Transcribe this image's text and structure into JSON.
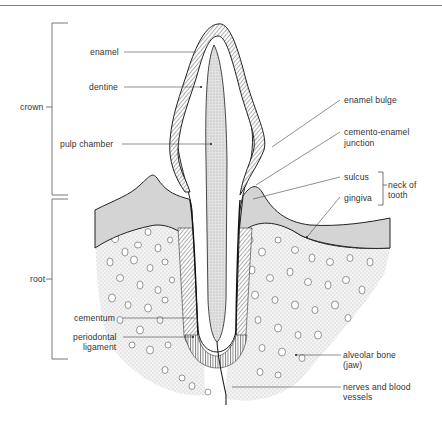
{
  "diagram": {
    "regions": {
      "crown": "crown",
      "root": "root",
      "neck": "neck of tooth"
    },
    "labels_left": [
      {
        "id": "enamel",
        "text": "enamel"
      },
      {
        "id": "dentine",
        "text": "dentine"
      },
      {
        "id": "pulp_chamber",
        "text": "pulp chamber"
      },
      {
        "id": "cementum",
        "text": "cementum"
      },
      {
        "id": "periodontal_ligament_1",
        "text": "periodontal"
      },
      {
        "id": "periodontal_ligament_2",
        "text": "ligament"
      }
    ],
    "labels_right": [
      {
        "id": "enamel_bulge",
        "text": "enamel bulge"
      },
      {
        "id": "cej_1",
        "text": "cemento-enamel"
      },
      {
        "id": "cej_2",
        "text": "junction"
      },
      {
        "id": "sulcus",
        "text": "sulcus"
      },
      {
        "id": "gingiva",
        "text": "gingiva"
      },
      {
        "id": "neck_1",
        "text": "neck of"
      },
      {
        "id": "neck_2",
        "text": "tooth"
      },
      {
        "id": "alveolar_1",
        "text": "alveolar bone"
      },
      {
        "id": "alveolar_2",
        "text": "(jaw)"
      },
      {
        "id": "nerves_1",
        "text": "nerves and blood"
      },
      {
        "id": "nerves_2",
        "text": "vessels"
      }
    ],
    "colors": {
      "gingiva_fill": "#d4d4d4",
      "bone_fill": "#ececec",
      "pulp_fill": "#dcdcdc",
      "line": "#222222"
    }
  }
}
